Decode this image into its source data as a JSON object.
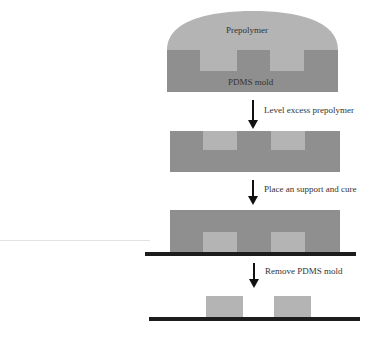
{
  "diagram": {
    "title": "",
    "stages": [
      {
        "id": "stage-1",
        "labels": {
          "top": "Prepolymer",
          "bottom": "PDMS mold"
        }
      },
      {
        "id": "stage-2"
      },
      {
        "id": "stage-3"
      },
      {
        "id": "stage-4"
      }
    ],
    "steps": [
      {
        "label": "Level excess prepolymer"
      },
      {
        "label": "Place an support and cure"
      },
      {
        "label": "Remove PDMS mold"
      }
    ],
    "colors": {
      "prepolymer": "#b4b4b4",
      "pdms_mold": "#8f8f8f",
      "support": "#1c1c1c",
      "arrow": "#111111"
    }
  }
}
